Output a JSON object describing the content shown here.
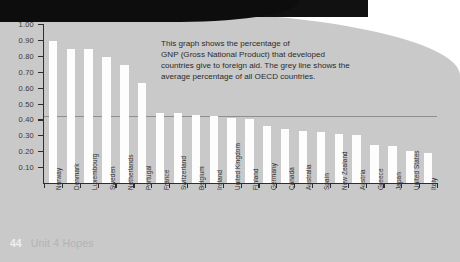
{
  "page": {
    "number": "44",
    "unit_label": "Unit 4 Hopes"
  },
  "callout": {
    "line1": "This graph shows the percentage of",
    "line2": "GNP (Gross National Product) that developed",
    "line3": "countries give to foreign aid. The grey line shows the",
    "line4": "average percentage of all OECD countries."
  },
  "colors": {
    "page_background": "#c9c9c9",
    "bar": "#fdfdfd",
    "axis": "#2e2e2e",
    "average_line": "#8f8f8f",
    "text": "#2b2b2b"
  },
  "chart_data": {
    "type": "bar",
    "title": "",
    "xlabel": "",
    "ylabel": "",
    "ylim": [
      0.0,
      1.0
    ],
    "grid": false,
    "legend": "none",
    "ytick_labels": [
      "1.00",
      "0.90",
      "0.80",
      "0.70",
      "0.60",
      "0.50",
      "0.40",
      "0.30",
      "0.20",
      "0.10"
    ],
    "ytick_values": [
      1.0,
      0.9,
      0.8,
      0.7,
      0.6,
      0.5,
      0.4,
      0.3,
      0.2,
      0.1
    ],
    "categories": [
      "Norway",
      "Denmark",
      "Luxembourg",
      "Sweden",
      "Netherlands",
      "Portugal",
      "France",
      "Switzerland",
      "Belgium",
      "Ireland",
      "United Kingdom",
      "Finland",
      "Germany",
      "Canada",
      "Australia",
      "Spain",
      "New Zealand",
      "Austria",
      "Greece",
      "Japan",
      "United States",
      "Italy"
    ],
    "values": [
      0.89,
      0.84,
      0.84,
      0.79,
      0.74,
      0.63,
      0.44,
      0.44,
      0.43,
      0.42,
      0.41,
      0.4,
      0.36,
      0.34,
      0.33,
      0.32,
      0.31,
      0.3,
      0.24,
      0.23,
      0.2,
      0.19
    ],
    "annotations": [
      {
        "name": "average-line",
        "type": "hline",
        "value": 0.42,
        "label": "average percentage of all OECD countries"
      }
    ]
  }
}
